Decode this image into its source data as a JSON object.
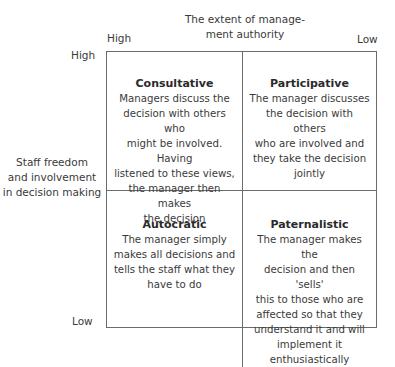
{
  "x_axis": {
    "title": "The extent of manage-\nment authority",
    "title_line1": "The extent of manage-",
    "title_line2": "ment authority",
    "high_label": "High",
    "low_label": "Low"
  },
  "y_axis": {
    "title_line1": "Staff freedom",
    "title_line2": "and involvement",
    "title_line3": "in decision making",
    "high_label": "High",
    "low_label": "Low"
  },
  "quadrants": [
    {
      "position": "top-left",
      "title": "Consultative",
      "lines": [
        "Managers discuss the",
        "decision with others who",
        "might be involved. Having",
        "listened to these views,",
        "the manager then makes",
        "the decision"
      ]
    },
    {
      "position": "top-right",
      "title": "Participative",
      "lines": [
        "The manager discusses",
        "the decision with others",
        "who are involved and",
        "they take the decision",
        "jointly"
      ]
    },
    {
      "position": "bottom-left",
      "title": "Autocratic",
      "lines": [
        "The manager simply",
        "makes all decisions and",
        "tells the staff what they",
        "have to do"
      ]
    },
    {
      "position": "bottom-right",
      "title": "Paternalistic",
      "lines": [
        "The manager makes the",
        "decision and then 'sells'",
        "this to those who are",
        "affected so that they",
        "understand it and will",
        "implement it enthusiastically"
      ]
    }
  ],
  "colors": {
    "line": "#6b6b6b",
    "text": "#3a3a3a",
    "background": "#ffffff"
  }
}
